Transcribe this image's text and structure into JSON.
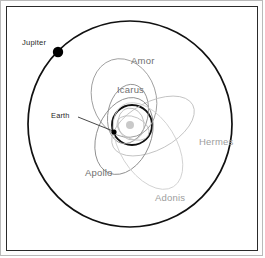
{
  "figure": {
    "width": 265,
    "height": 258,
    "background": "#ffffff",
    "frame": {
      "outer_border_color": "#b9b9b9",
      "inner_border_color": "#2a2a2a"
    }
  },
  "colors": {
    "jupiter_orbit": "#111111",
    "earth_orbit": "#111111",
    "jupiter_body": "#000000",
    "earth_body": "#000000",
    "sun_body": "#c9c9c9",
    "amor": "#9a9a9a",
    "icarus": "#8d8d8d",
    "hermes": "#c0c0c0",
    "apollo": "#8a8a8a",
    "adonis": "#cfcfcf",
    "leader_line": "#333333",
    "label_dark": "#1f1f1f",
    "label_mid": "#6f6f6f",
    "label_light": "#9d9d9d"
  },
  "center": {
    "x": 130,
    "y": 124
  },
  "bodies": [
    {
      "id": "jupiter",
      "label": "Jupiter",
      "dot": {
        "x": 58,
        "y": 52,
        "r": 5.2,
        "fill": "#000000"
      },
      "label_pos": {
        "x": 22,
        "y": 39
      },
      "label_color": "#1f1f1f",
      "label_size": 7.6
    },
    {
      "id": "earth",
      "label": "Earth",
      "dot": {
        "x": 114,
        "y": 132,
        "r": 2.6,
        "fill": "#000000"
      },
      "label_pos": {
        "x": 51,
        "y": 112
      },
      "label_color": "#1f1f1f",
      "label_size": 7.4,
      "leader": {
        "x1": 78,
        "y1": 117,
        "x2": 113,
        "y2": 131
      }
    },
    {
      "id": "sun",
      "label": "",
      "dot": {
        "x": 130,
        "y": 125,
        "r": 4.0,
        "fill": "#c9c9c9"
      },
      "label_pos": {
        "x": 0,
        "y": 0
      },
      "label_color": "#c9c9c9",
      "label_size": 0
    }
  ],
  "orbits": [
    {
      "id": "jupiter-orbit",
      "name": "Jupiter orbit",
      "cx": 130,
      "cy": 124,
      "rx": 102,
      "ry": 103,
      "rotate": 0,
      "stroke": "#111111",
      "width": 1.7
    },
    {
      "id": "earth-orbit",
      "name": "Earth orbit",
      "cx": 132,
      "cy": 125,
      "rx": 20,
      "ry": 20,
      "rotate": 0,
      "stroke": "#111111",
      "width": 1.9
    },
    {
      "id": "amor-orbit",
      "name": "Amor orbit",
      "cx": 124,
      "cy": 98,
      "rx": 32,
      "ry": 40,
      "rotate": -18,
      "stroke": "#9a9a9a",
      "width": 0.85
    },
    {
      "id": "icarus-orbit",
      "name": "Icarus orbit",
      "cx": 128,
      "cy": 114,
      "rx": 20,
      "ry": 30,
      "rotate": 12,
      "stroke": "#8d8d8d",
      "width": 0.85
    },
    {
      "id": "hermes-orbit",
      "name": "Hermes orbit",
      "cx": 153,
      "cy": 126,
      "rx": 45,
      "ry": 24,
      "rotate": -28,
      "stroke": "#c0c0c0",
      "width": 0.85
    },
    {
      "id": "apollo-orbit",
      "name": "Apollo orbit",
      "cx": 124,
      "cy": 136,
      "rx": 27,
      "ry": 40,
      "rotate": 22,
      "stroke": "#8a8a8a",
      "width": 0.85
    },
    {
      "id": "adonis-orbit",
      "name": "Adonis orbit",
      "cx": 148,
      "cy": 146,
      "rx": 28,
      "ry": 48,
      "rotate": -32,
      "stroke": "#cfcfcf",
      "width": 0.85
    },
    {
      "id": "inner-small-orbit",
      "name": "inner small orbit",
      "cx": 131,
      "cy": 124,
      "rx": 13,
      "ry": 16,
      "rotate": -10,
      "stroke": "#b5b5b5",
      "width": 0.8
    },
    {
      "id": "inner-small-orbit-2",
      "name": "inner small orbit 2",
      "cx": 133,
      "cy": 128,
      "rx": 17,
      "ry": 11,
      "rotate": 25,
      "stroke": "#bdbdbd",
      "width": 0.8
    }
  ],
  "labels": [
    {
      "id": "amor",
      "text": "Amor",
      "x": 131,
      "y": 56,
      "color": "#6f6f6f",
      "size": 9.5
    },
    {
      "id": "icarus",
      "text": "Icarus",
      "x": 117,
      "y": 85,
      "color": "#6f6f6f",
      "size": 9.5
    },
    {
      "id": "hermes",
      "text": "Hermes",
      "x": 199,
      "y": 137,
      "color": "#9d9d9d",
      "size": 9.5
    },
    {
      "id": "apollo",
      "text": "Apollo",
      "x": 85,
      "y": 168,
      "color": "#6f6f6f",
      "size": 9.5
    },
    {
      "id": "adonis",
      "text": "Adonis",
      "x": 155,
      "y": 193,
      "color": "#9d9d9d",
      "size": 9.5
    }
  ]
}
